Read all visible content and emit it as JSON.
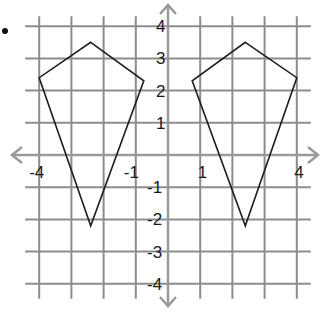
{
  "bullet": "•",
  "grid": {
    "xmin": -4,
    "xmax": 4,
    "ymin": -4,
    "ymax": 4,
    "grid_color": "#8c8c8c",
    "axis_color": "#9a9a9a",
    "shape_color": "#1e1e1e"
  },
  "axis_labels": {
    "x": [
      {
        "value": -4,
        "text": "-4"
      },
      {
        "value": -1,
        "text": "-1"
      },
      {
        "value": 1,
        "text": "1"
      },
      {
        "value": 4,
        "text": "4"
      }
    ],
    "y": [
      {
        "value": 4,
        "text": "4"
      },
      {
        "value": 3,
        "text": "3"
      },
      {
        "value": 2,
        "text": "2"
      },
      {
        "value": 1,
        "text": "1"
      },
      {
        "value": -1,
        "text": "-1"
      },
      {
        "value": -2,
        "text": "-2"
      },
      {
        "value": -3,
        "text": "-3"
      },
      {
        "value": -4,
        "text": "-4"
      }
    ]
  },
  "shapes": [
    {
      "name": "left-kite",
      "vertices": [
        [
          -2.4,
          3.5
        ],
        [
          -0.75,
          2.3
        ],
        [
          -2.4,
          -2.2
        ],
        [
          -4,
          2.4
        ]
      ]
    },
    {
      "name": "right-kite",
      "vertices": [
        [
          2.4,
          3.5
        ],
        [
          4,
          2.4
        ],
        [
          2.4,
          -2.2
        ],
        [
          0.75,
          2.3
        ]
      ]
    }
  ]
}
